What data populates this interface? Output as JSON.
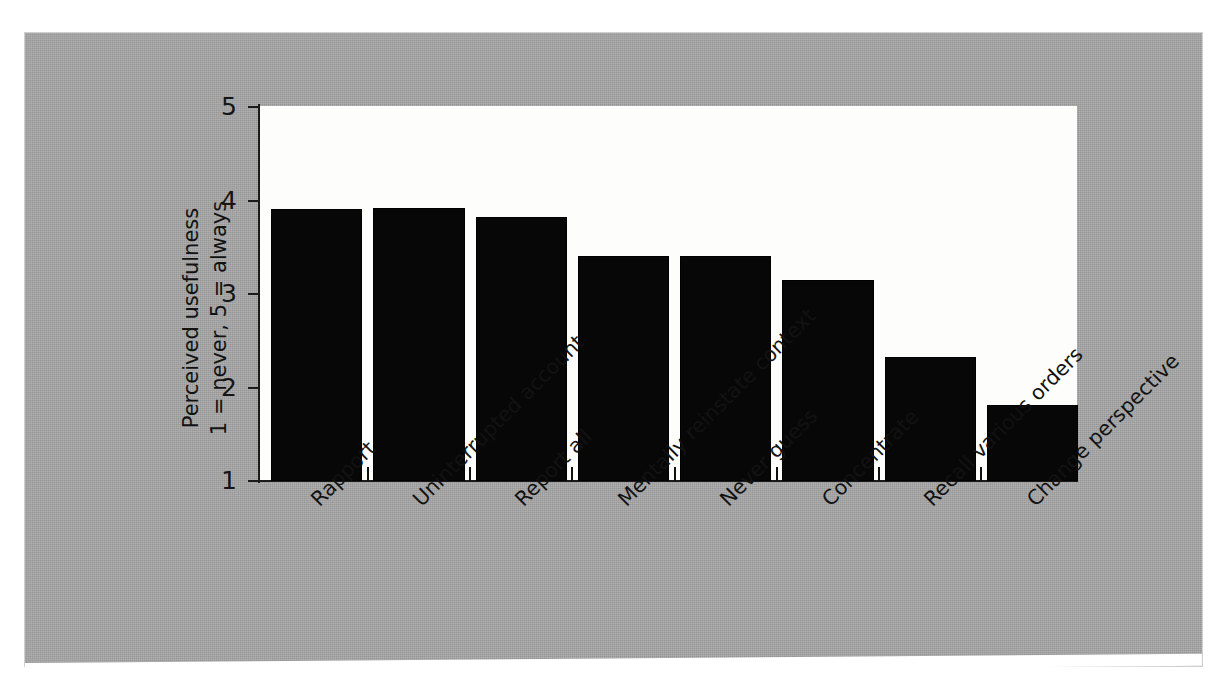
{
  "figure": {
    "background_color": "#a8a8a8",
    "plot_background_color": "#fdfdfb",
    "bar_color": "#070707",
    "axis_color": "#1b1b1b"
  },
  "axis": {
    "y_title_line1": "Perceived usefulness",
    "y_title_line2": "1 = never, 5 = always",
    "y_ticks": [
      "1",
      "2",
      "3",
      "4",
      "5"
    ]
  },
  "caption": {
    "partial_text": "cut-off caption text at page bottom"
  },
  "chart_data": {
    "type": "bar",
    "title": "",
    "xlabel": "",
    "ylabel": "Perceived usefulness 1 = never, 5 = always",
    "ylim": [
      1,
      5
    ],
    "yticks": [
      1,
      2,
      3,
      4,
      5
    ],
    "grid": false,
    "legend": "none",
    "categories": [
      "Rapport",
      "Uninterrupted account",
      "Report all",
      "Mentally reinstate context",
      "Never guess",
      "Concentrate",
      "Recall various orders",
      "Change perspective"
    ],
    "values": [
      3.88,
      3.89,
      3.79,
      3.38,
      3.38,
      3.12,
      2.3,
      1.79
    ]
  }
}
